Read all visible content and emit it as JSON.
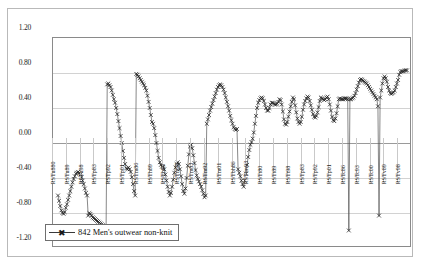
{
  "chart_data": {
    "type": "line",
    "title": "",
    "subtitle": "",
    "xlabel": "",
    "ylabel": "",
    "ylim": [
      -1.2,
      1.2
    ],
    "ytick_labels": [
      "1.20",
      "0.80",
      "0.40",
      "0.00",
      "-0.40",
      "-0.80",
      "-1.20"
    ],
    "ytick_values": [
      1.2,
      0.8,
      0.4,
      0.0,
      -0.4,
      -0.8,
      -1.2
    ],
    "grid": true,
    "legend_position": "inside-bottom-left",
    "marker": "x",
    "line_color": "#555555",
    "marker_color": "#222222",
    "series": [
      {
        "name": "842  Men's outwear non-knit",
        "code": "842",
        "label": "Men's outwear non-knit",
        "values": [
          -0.6,
          -0.66,
          -0.72,
          -0.77,
          -0.8,
          -0.81,
          -0.79,
          -0.74,
          -0.7,
          -0.65,
          -0.6,
          -0.55,
          -0.5,
          -0.45,
          -0.41,
          -0.38,
          -0.35,
          -0.34,
          -0.33,
          -0.34,
          -0.36,
          -0.39,
          -0.43,
          -0.47,
          -0.52,
          -0.57,
          -0.6,
          -0.83,
          -0.8,
          -0.81,
          -0.83,
          -0.85,
          -0.86,
          -0.87,
          -0.88,
          -0.89,
          -0.9,
          -0.91,
          -0.92,
          -0.93,
          -0.94,
          -0.95,
          -0.96,
          -0.96,
          0.67,
          0.68,
          0.66,
          0.64,
          0.6,
          0.55,
          0.5,
          0.46,
          0.4,
          0.33,
          0.25,
          0.17,
          0.08,
          0.0,
          -0.09,
          -0.17,
          -0.24,
          -0.29,
          -0.3,
          -0.28,
          -0.3,
          -0.33,
          -0.39,
          -0.47,
          -0.55,
          -0.6,
          0.79,
          0.78,
          0.76,
          0.74,
          0.72,
          0.7,
          0.68,
          0.66,
          0.63,
          0.6,
          0.54,
          0.47,
          0.4,
          0.32,
          0.24,
          0.22,
          0.17,
          0.09,
          0.0,
          -0.09,
          -0.17,
          -0.22,
          -0.25,
          -0.27,
          -0.27,
          -0.3,
          -0.36,
          -0.43,
          -0.5,
          -0.56,
          -0.6,
          -0.57,
          -0.5,
          -0.42,
          -0.34,
          -0.28,
          -0.24,
          -0.22,
          -0.24,
          -0.3,
          -0.38,
          -0.47,
          -0.55,
          -0.58,
          -0.52,
          -0.4,
          -0.26,
          -0.13,
          -0.04,
          -0.02,
          -0.06,
          -0.14,
          -0.23,
          -0.31,
          -0.37,
          -0.41,
          -0.44,
          -0.47,
          -0.5,
          -0.54,
          -0.58,
          -0.62,
          -0.6,
          0.22,
          0.27,
          0.32,
          0.37,
          0.41,
          0.45,
          0.49,
          0.53,
          0.57,
          0.61,
          0.64,
          0.66,
          0.67,
          0.66,
          0.64,
          0.61,
          0.57,
          0.52,
          0.47,
          0.42,
          0.37,
          0.31,
          0.26,
          0.22,
          0.18,
          0.16,
          0.15,
          0.16,
          -0.3,
          -0.34,
          -0.38,
          -0.43,
          -0.47,
          -0.5,
          -0.43,
          -0.35,
          -0.25,
          -0.16,
          -0.08,
          -0.02,
          0.01,
          0.05,
          0.12,
          0.22,
          0.31,
          0.4,
          0.46,
          0.49,
          0.51,
          0.52,
          0.51,
          0.48,
          0.44,
          0.4,
          0.37,
          0.37,
          0.4,
          0.44,
          0.46,
          0.46,
          0.45,
          0.44,
          0.44,
          0.45,
          0.47,
          0.5,
          0.49,
          0.44,
          0.36,
          0.27,
          0.22,
          0.21,
          0.24,
          0.3,
          0.36,
          0.42,
          0.47,
          0.52,
          0.5,
          0.43,
          0.35,
          0.28,
          0.24,
          0.22,
          0.24,
          0.3,
          0.38,
          0.44,
          0.48,
          0.51,
          0.53,
          0.52,
          0.48,
          0.43,
          0.38,
          0.33,
          0.3,
          0.29,
          0.31,
          0.35,
          0.41,
          0.48,
          0.52,
          0.51,
          0.5,
          0.49,
          0.5,
          0.52,
          0.53,
          0.5,
          0.44,
          0.37,
          0.3,
          0.26,
          0.25,
          0.28,
          0.34,
          0.42,
          0.5,
          0.51,
          0.5,
          0.5,
          0.5,
          0.51,
          0.51,
          0.51,
          0.5,
          -1.0,
          0.5,
          0.5,
          0.51,
          0.52,
          0.54,
          0.57,
          0.61,
          0.65,
          0.69,
          0.72,
          0.73,
          0.72,
          0.71,
          0.7,
          0.69,
          0.68,
          0.66,
          0.64,
          0.62,
          0.6,
          0.58,
          0.56,
          0.54,
          0.52,
          0.5,
          0.42,
          -0.83,
          0.52,
          0.6,
          0.68,
          0.74,
          0.76,
          0.74,
          0.7,
          0.64,
          0.6,
          0.57,
          0.56,
          0.57,
          0.58,
          0.6,
          0.64,
          0.68,
          0.72,
          0.78,
          0.81,
          0.82,
          0.82,
          0.82,
          0.83,
          0.83,
          0.83
        ],
        "xtick_labels": [
          "RSTu880",
          "RSTu89",
          "RSTu98",
          "RSTp83",
          "RSTp92",
          "RSTp01",
          "RSTm86",
          "RSTh89",
          "RSTh89",
          "RSTm98",
          "RSTm83",
          "RSTm92",
          "RSTm01",
          "RSTbh86",
          "RSTtm93",
          "RSTt80",
          "RSTt89",
          "RSTt98",
          "RSTp83",
          "RSTp92",
          "RSTp01",
          "RSTc86",
          "RSTc93",
          "RSTc00",
          "RSTv89",
          "RSTv98"
        ]
      }
    ]
  },
  "legend": {
    "entries": [
      {
        "code": "842",
        "label": "Men's outwear non-knit",
        "full": "842   Men's outwear non-knit",
        "marker_glyph": "✖"
      }
    ]
  },
  "axes": {
    "y": {
      "ticks": [
        "1.20",
        "0.80",
        "0.40",
        "0.00",
        "-0.40",
        "-0.80",
        "-1.20"
      ]
    },
    "x": {
      "ticks": [
        "RSTu880",
        "RSTu89",
        "RSTu98",
        "RSTp83",
        "RSTp92",
        "RSTp01",
        "RSTm86",
        "RSTh89",
        "RSTh89",
        "RSTm98",
        "RSTm83",
        "RSTm92",
        "RSTm01",
        "RSTbh86",
        "RSTtm93",
        "RSTt80",
        "RSTt89",
        "RSTt98",
        "RSTp83",
        "RSTp92",
        "RSTp01",
        "RSTc86",
        "RSTc93",
        "RSTc00",
        "RSTv89",
        "RSTv98"
      ]
    }
  },
  "colors": {
    "plot_border": "#8a8a8a",
    "outer_border": "#b9b9b9",
    "gridline": "#d2d2d2",
    "zeroline": "#9a9a9a",
    "series": "#555555",
    "background": "#ffffff"
  }
}
